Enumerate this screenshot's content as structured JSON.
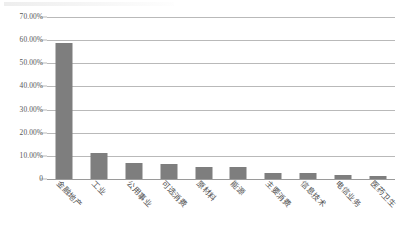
{
  "chart_data": {
    "type": "bar",
    "title": "",
    "subtitle": "",
    "xlabel": "",
    "ylabel": "",
    "categories": [
      "金融地产",
      "工业",
      "公用事业",
      "可选消费",
      "原材料",
      "能源",
      "主要消费",
      "信息技术",
      "电信业务",
      "医药卫生"
    ],
    "values": [
      58.8,
      11.2,
      6.8,
      6.7,
      5.3,
      5.0,
      2.8,
      2.5,
      1.9,
      1.4
    ],
    "value_unit": "%",
    "ylim": [
      0,
      70
    ],
    "ytick_values": [
      70,
      60,
      50,
      40,
      30,
      20,
      10,
      0
    ],
    "ytick_labels": [
      "70.00%",
      "60.00%",
      "50.00%",
      "40.00%",
      "30.00%",
      "20.00%",
      "10.00%",
      "0"
    ],
    "grid": true,
    "legend": false,
    "legend_position": "none",
    "series": [
      {
        "name": "占比",
        "values": [
          58.8,
          11.2,
          6.8,
          6.7,
          5.3,
          5.0,
          2.8,
          2.5,
          1.9,
          1.4
        ]
      }
    ],
    "annotations": []
  },
  "style": {
    "bar_color": "#7e7e7e",
    "gridline_color": "#b9b9b9",
    "axis_color": "#9a9a9a",
    "text_color": "#555555",
    "background": "#ffffff"
  }
}
